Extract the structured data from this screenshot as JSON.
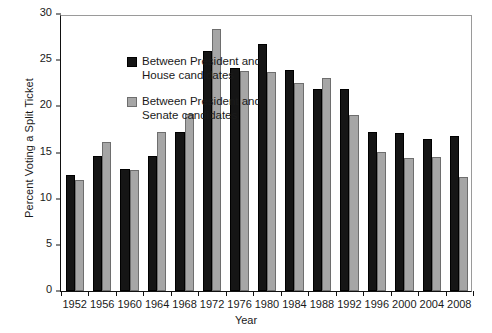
{
  "chart_data": {
    "type": "bar",
    "title": "",
    "xlabel": "Year",
    "ylabel": "Percent Voting a Split Ticket",
    "ylim": [
      0,
      30
    ],
    "yticks": [
      0,
      5,
      10,
      15,
      20,
      25,
      30
    ],
    "grid": false,
    "legend_position": "upper-left-inside",
    "categories": [
      "1952",
      "1956",
      "1960",
      "1964",
      "1968",
      "1972",
      "1976",
      "1980",
      "1984",
      "1988",
      "1992",
      "1996",
      "2000",
      "2004",
      "2008"
    ],
    "series": [
      {
        "name": "Between President and\nHouse candidates",
        "color": "#151515",
        "values": [
          12.6,
          14.6,
          13.2,
          14.6,
          17.2,
          26.0,
          24.2,
          26.8,
          23.9,
          21.9,
          21.9,
          17.2,
          17.1,
          16.5,
          16.8
        ]
      },
      {
        "name": "Between President and\nSenate candidates",
        "color": "#a6a6a6",
        "values": [
          12.0,
          16.1,
          13.1,
          17.2,
          19.2,
          28.4,
          23.8,
          23.7,
          22.5,
          23.1,
          19.1,
          15.1,
          14.4,
          14.5,
          12.3
        ]
      }
    ]
  },
  "axis": {
    "y_title": "Percent Voting a Split Ticket",
    "x_title": "Year"
  }
}
